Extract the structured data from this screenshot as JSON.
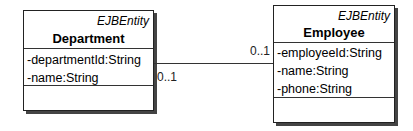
{
  "diagram": {
    "classes": [
      {
        "stereotype": "EJBEntity",
        "name": "Department",
        "attributes": [
          "-departmentId:String",
          "-name:String"
        ]
      },
      {
        "stereotype": "EJBEntity",
        "name": "Employee",
        "attributes": [
          "-employeeId:String",
          "-name:String",
          "-phone:String"
        ]
      }
    ],
    "association": {
      "department_end_multiplicity": "0..1",
      "employee_end_multiplicity": "0..1"
    }
  }
}
